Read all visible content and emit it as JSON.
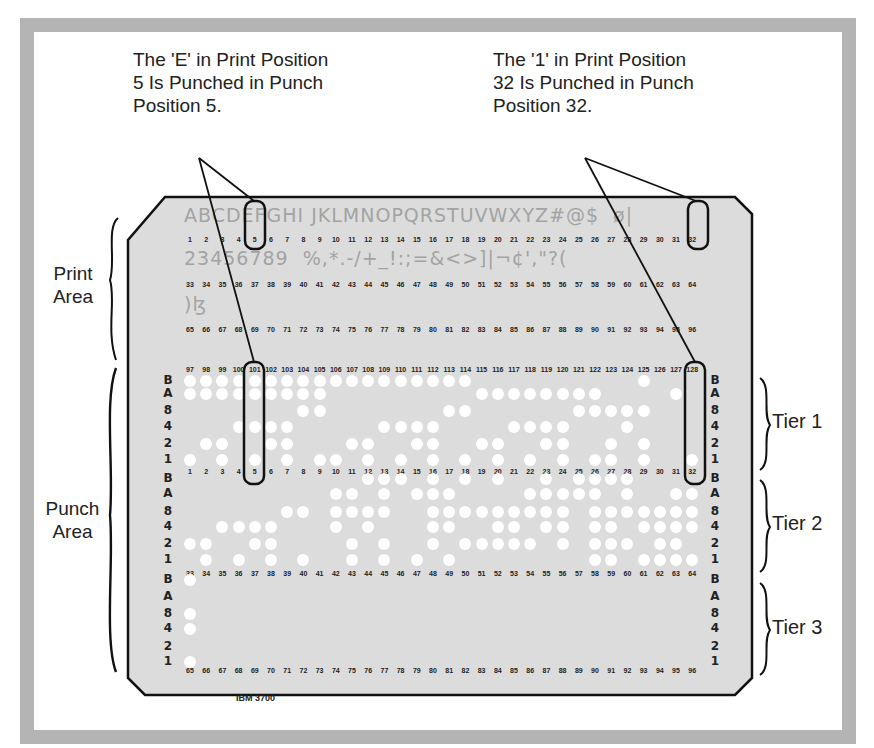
{
  "callouts": {
    "left": "The 'E' in Print Position\n5 Is Punched in Punch\nPosition 5.",
    "right": "The '1' in Print Position\n32 Is Punched in Punch\nPosition 32."
  },
  "side_labels": {
    "print_area": "Print\nArea",
    "punch_area": "Punch\nArea"
  },
  "tiers": [
    "Tier 1",
    "Tier 2",
    "Tier 3"
  ],
  "card": {
    "model": "IBM 3700",
    "print_line_1": "ABCDEFGHI JKLMNOPQRSTUVWXYZ#@$  ø|",
    "print_line_2": "23456789  %,*.-/+_!:;=&<>]|¬¢',\"?(",
    "print_line_3": ")ɮ",
    "row_labels": [
      "B",
      "A",
      "8",
      "4",
      "2",
      "1"
    ],
    "highlight_print_positions": [
      5,
      32
    ]
  },
  "chart_data": {
    "type": "diagram",
    "print_positions": {
      "row1": [
        1,
        32
      ],
      "row2": [
        33,
        64
      ],
      "row3": [
        65,
        96
      ],
      "row4": [
        97,
        128
      ]
    },
    "punch_rows": [
      "B",
      "A",
      "8",
      "4",
      "2",
      "1"
    ],
    "tiers": [
      {
        "name": "Tier 1",
        "positions": "1-32 (print 97-128 labels above)",
        "punches": {
          "B": [
            1,
            2,
            3,
            4,
            5,
            6,
            7,
            8,
            9,
            10,
            11,
            12,
            13,
            14,
            15,
            16,
            17,
            18,
            29
          ],
          "A": [
            1,
            2,
            3,
            4,
            5,
            6,
            7,
            8,
            9,
            19,
            20,
            21,
            22,
            23,
            24,
            25,
            26,
            31
          ],
          "8": [
            8,
            9,
            17,
            18,
            25,
            26,
            27,
            28,
            29
          ],
          "4": [
            4,
            5,
            6,
            7,
            13,
            14,
            15,
            16,
            21,
            22,
            23,
            24,
            28
          ],
          "2": [
            2,
            3,
            6,
            7,
            11,
            12,
            15,
            16,
            19,
            20,
            23,
            24,
            27,
            29
          ],
          "1": [
            1,
            3,
            5,
            7,
            9,
            10,
            12,
            14,
            16,
            18,
            20,
            22,
            24,
            26,
            27,
            29,
            32
          ]
        }
      },
      {
        "name": "Tier 2",
        "positions": "33-64",
        "punches": {
          "B": [
            12,
            13,
            14,
            16,
            18,
            20,
            23,
            25,
            26,
            27,
            28
          ],
          "A": [
            10,
            11,
            13,
            15,
            16,
            17,
            22,
            23,
            24,
            25,
            26,
            28,
            31,
            32
          ],
          "8": [
            7,
            8,
            10,
            11,
            12,
            13,
            16,
            17,
            18,
            19,
            20,
            21,
            22,
            23,
            24,
            26,
            27,
            28,
            29,
            30,
            31,
            32
          ],
          "4": [
            3,
            4,
            5,
            6,
            10,
            12,
            16,
            17,
            20,
            21,
            23,
            24,
            26,
            27,
            29,
            30,
            31,
            32
          ],
          "2": [
            1,
            2,
            5,
            6,
            11,
            13,
            16,
            18,
            19,
            20,
            21,
            22,
            24,
            26,
            27,
            28,
            30,
            31
          ],
          "1": [
            2,
            4,
            6,
            8,
            11,
            13,
            15,
            17,
            26,
            27,
            29,
            30,
            31,
            32
          ]
        }
      },
      {
        "name": "Tier 3",
        "positions": "65-96",
        "punches": {
          "B": [
            1
          ],
          "A": [],
          "8": [
            1
          ],
          "4": [
            1
          ],
          "2": [],
          "1": [
            1
          ]
        }
      }
    ]
  }
}
